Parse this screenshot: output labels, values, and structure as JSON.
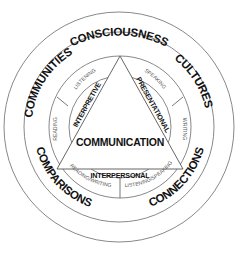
{
  "diagram": {
    "outer_ring": {
      "top": "CONSCIOUSNESS"
    },
    "standards": {
      "upper_left": "COMMUNITIES",
      "upper_right": "CULTURES",
      "lower_left": "COMPARISONS",
      "lower_right": "CONNECTIONS"
    },
    "skills": {
      "listening": "LISTENING",
      "speaking": "SPEAKING",
      "reading": "READING",
      "writing": "WRITING",
      "reading_writing": "READING/WRITING",
      "listening_speaking": "LISTENING/SPEAKING"
    },
    "modes": {
      "interpretive": "INTERPRETIVE",
      "presentational": "PRESENTATIONAL",
      "interpersonal": "INTERPERSONAL"
    },
    "center": "COMMUNICATION"
  }
}
